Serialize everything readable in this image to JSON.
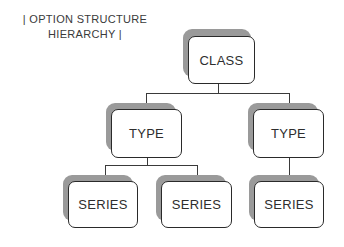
{
  "title": {
    "line1": "| OPTION STRUCTURE",
    "line2": "HIERARCHY |"
  },
  "nodes": {
    "root": {
      "label": "CLASS"
    },
    "type_left": {
      "label": "TYPE"
    },
    "type_right": {
      "label": "TYPE"
    },
    "series_1": {
      "label": "SERIES"
    },
    "series_2": {
      "label": "SERIES"
    },
    "series_3": {
      "label": "SERIES"
    }
  },
  "colors": {
    "box_border": "#2a2a2a",
    "shadow": "#9a9a9a",
    "connector": "#3a3a3a"
  }
}
